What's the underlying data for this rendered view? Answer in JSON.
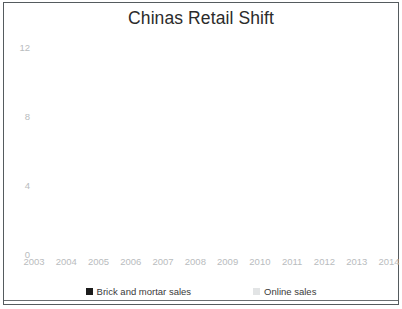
{
  "chart": {
    "title": "Chinas Retail Shift",
    "legend": [
      {
        "label": "Brick and mortar sales",
        "color": "#1c1c1c",
        "marker": "square-marker"
      },
      {
        "label": "Online sales",
        "color": "#e2e4e5",
        "marker": "square-marker"
      }
    ]
  },
  "axes": {
    "y_ticks": [
      "0",
      "4",
      "8",
      "12"
    ],
    "x_ticks": [
      "2003",
      "2004",
      "2005",
      "2006",
      "2007",
      "2008",
      "2009",
      "2010",
      "2011",
      "2012",
      "2013",
      "2014"
    ]
  },
  "colors": {
    "brick_line": "#1c1c1c",
    "online_line": "#e2e4e5",
    "grid": "#f1f2f3",
    "frame": "#555b5e",
    "tick_text": "#b9bcbe",
    "title_text": "#2b2b2b"
  },
  "chart_data": {
    "type": "line",
    "title": "Chinas Retail Shift",
    "xlabel": "",
    "ylabel": "",
    "x": [
      2003,
      2004,
      2005,
      2006,
      2007,
      2008,
      2009,
      2010,
      2011,
      2012,
      2013,
      2014
    ],
    "categories": [
      "2003",
      "2004",
      "2005",
      "2006",
      "2007",
      "2008",
      "2009",
      "2010",
      "2011",
      "2012",
      "2013",
      "2014"
    ],
    "series": [
      {
        "name": "Brick and mortar sales",
        "color": "#1c1c1c",
        "values": [
          7.7,
          9.4,
          10.8,
          11.2,
          11.2,
          11.2,
          11.2,
          11.2,
          11.2,
          9.2,
          8.7,
          8.2
        ]
      },
      {
        "name": "Online sales",
        "color": "#e2e4e5",
        "values": [
          null,
          null,
          null,
          null,
          null,
          1.0,
          2.6,
          4.2,
          5.7,
          7.2,
          8.7,
          11.3
        ]
      }
    ],
    "xlim": [
      2003,
      2014
    ],
    "ylim": [
      0,
      12
    ],
    "ytick_values": [
      0,
      4,
      8,
      12
    ],
    "grid": true,
    "legend_position": "bottom"
  }
}
